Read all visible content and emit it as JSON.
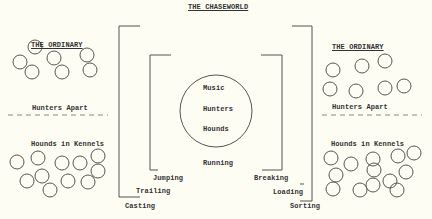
{
  "title": "THE CHASEWORLD",
  "left_panel": {
    "heading": "THE ORDINARY",
    "divider_label": "Hunters Apart",
    "lower_label": "Hounds in Kennels",
    "upper_circles": [
      [
        35,
        47,
        7
      ],
      [
        20,
        62,
        7
      ],
      [
        54,
        58,
        7
      ],
      [
        87,
        55,
        7
      ],
      [
        32,
        72,
        7
      ],
      [
        62,
        72,
        7
      ],
      [
        90,
        70,
        7
      ]
    ],
    "lower_circles": [
      [
        17,
        162,
        7
      ],
      [
        38,
        158,
        7
      ],
      [
        62,
        163,
        7
      ],
      [
        80,
        163,
        7
      ],
      [
        98,
        156,
        7
      ],
      [
        27,
        181,
        7
      ],
      [
        42,
        176,
        7
      ],
      [
        68,
        181,
        7
      ],
      [
        50,
        190,
        7
      ],
      [
        98,
        171,
        7
      ],
      [
        88,
        182,
        7
      ]
    ]
  },
  "right_panel": {
    "heading": "THE ORDINARY",
    "divider_label": "Hunters Apart",
    "lower_label": "Hounds in Kennels",
    "upper_circles": [
      [
        333,
        70,
        7
      ],
      [
        362,
        66,
        7
      ],
      [
        385,
        61,
        7
      ],
      [
        330,
        89,
        7
      ],
      [
        356,
        91,
        7
      ],
      [
        385,
        88,
        7
      ],
      [
        404,
        86,
        7
      ]
    ],
    "lower_circles": [
      [
        331,
        158,
        7
      ],
      [
        351,
        164,
        7
      ],
      [
        373,
        159,
        7
      ],
      [
        398,
        156,
        7
      ],
      [
        414,
        153,
        7
      ],
      [
        336,
        175,
        7
      ],
      [
        374,
        170,
        7
      ],
      [
        406,
        172,
        7
      ],
      [
        390,
        181,
        7
      ],
      [
        333,
        189,
        7
      ],
      [
        360,
        190,
        7
      ],
      [
        373,
        185,
        7
      ],
      [
        397,
        190,
        7
      ]
    ]
  },
  "center": {
    "circle_labels": [
      "Music",
      "Hunters",
      "Hounds"
    ],
    "below_label": "Running",
    "inner_left_label": "Jumping",
    "inner_right_label": "Breaking",
    "middle_left_label": "Trailing",
    "middle_right_label": "Loading",
    "outer_left_label": "Casting",
    "outer_right_label": "Sorting"
  },
  "colors": {
    "background": "#fdfdf3",
    "ink": "#333333",
    "dash": "#888888"
  }
}
